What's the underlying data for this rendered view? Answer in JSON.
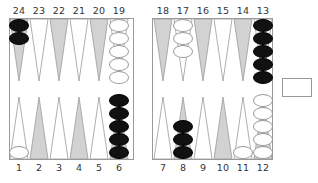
{
  "game": "backgammon",
  "colors": {
    "shaded_point": "#d2d2d2",
    "plain_point": "#ffffff",
    "point_outline": "#9a9a9a",
    "black_checker": "#111111",
    "white_checker": "#ffffff"
  },
  "top_labels": [
    "24",
    "23",
    "22",
    "21",
    "20",
    "19",
    "18",
    "17",
    "16",
    "15",
    "14",
    "13"
  ],
  "bottom_labels": [
    "1",
    "2",
    "3",
    "4",
    "5",
    "6",
    "7",
    "8",
    "9",
    "10",
    "11",
    "12"
  ],
  "points": [
    {
      "point": 1,
      "shaded": false,
      "color": "white",
      "count": 1
    },
    {
      "point": 2,
      "shaded": true,
      "color": null,
      "count": 0
    },
    {
      "point": 3,
      "shaded": false,
      "color": null,
      "count": 0
    },
    {
      "point": 4,
      "shaded": true,
      "color": null,
      "count": 0
    },
    {
      "point": 5,
      "shaded": false,
      "color": null,
      "count": 0
    },
    {
      "point": 6,
      "shaded": true,
      "color": "black",
      "count": 5
    },
    {
      "point": 7,
      "shaded": false,
      "color": null,
      "count": 0
    },
    {
      "point": 8,
      "shaded": true,
      "color": "black",
      "count": 3
    },
    {
      "point": 9,
      "shaded": false,
      "color": null,
      "count": 0
    },
    {
      "point": 10,
      "shaded": true,
      "color": null,
      "count": 0
    },
    {
      "point": 11,
      "shaded": false,
      "color": "white",
      "count": 1
    },
    {
      "point": 12,
      "shaded": true,
      "color": "white",
      "count": 5
    },
    {
      "point": 13,
      "shaded": false,
      "color": "black",
      "count": 5
    },
    {
      "point": 14,
      "shaded": true,
      "color": null,
      "count": 0
    },
    {
      "point": 15,
      "shaded": false,
      "color": null,
      "count": 0
    },
    {
      "point": 16,
      "shaded": true,
      "color": null,
      "count": 0
    },
    {
      "point": 17,
      "shaded": false,
      "color": "white",
      "count": 3
    },
    {
      "point": 18,
      "shaded": true,
      "color": null,
      "count": 0
    },
    {
      "point": 19,
      "shaded": false,
      "color": "white",
      "count": 5
    },
    {
      "point": 20,
      "shaded": true,
      "color": null,
      "count": 0
    },
    {
      "point": 21,
      "shaded": false,
      "color": null,
      "count": 0
    },
    {
      "point": 22,
      "shaded": true,
      "color": null,
      "count": 0
    },
    {
      "point": 23,
      "shaded": false,
      "color": null,
      "count": 0
    },
    {
      "point": 24,
      "shaded": true,
      "color": "black",
      "count": 2
    }
  ],
  "bar": {
    "black": 0,
    "white": 0
  },
  "side_box": {
    "label": ""
  }
}
